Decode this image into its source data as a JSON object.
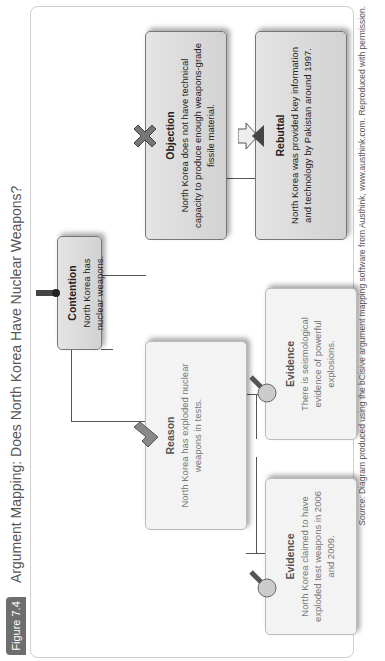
{
  "figure": {
    "tag": "Figure 7.4",
    "title": "Argument Mapping: Does North Korea Have Nuclear Weapons?"
  },
  "nodes": {
    "contention": {
      "label": "Contention",
      "text": "North Korea has nuclear weapons.",
      "icon": "flag-icon"
    },
    "objection": {
      "label": "Objection",
      "text": "North Korea does not have technical capacity to produce enough weapons-grade fissile material.",
      "icon": "x-cross-icon"
    },
    "rebuttal": {
      "label": "Rebuttal",
      "text": "North Korea was provided key information and technology by Pakistan around 1997.",
      "icon": "rebuttal-arrow-icon"
    },
    "reason": {
      "label": "Reason",
      "text": "North Korea has exploded nuclear weapons in tests.",
      "icon": "checkmark-icon"
    },
    "evidence_seismic": {
      "label": "Evidence",
      "text": "There is seismological evidence of powerful explosions.",
      "icon": "magnifier-icon"
    },
    "evidence_claim": {
      "label": "Evidence",
      "text": "North Korea claimed to have exploded test weapons in 2006 and 2009.",
      "icon": "magnifier-icon"
    }
  },
  "source": {
    "prefix": "Source:",
    "text": "Diagram produced using the bCisive argument mapping software from Austhink, www.austhink.com. Reproduced with permission."
  },
  "colors": {
    "tag_bg": "#6e6e6e",
    "box_bg": "#dcdcdc",
    "line": "#555555"
  }
}
